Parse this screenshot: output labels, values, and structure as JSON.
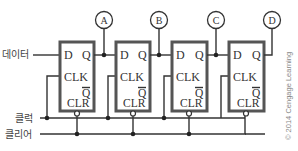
{
  "diagram": {
    "inputs": {
      "data_label": "데이터",
      "clock_label": "클럭",
      "clear_label": "클리어"
    },
    "outputs": [
      {
        "label": "A"
      },
      {
        "label": "B"
      },
      {
        "label": "C"
      },
      {
        "label": "D"
      }
    ],
    "flip_flops": [
      {
        "d": "D",
        "q": "Q",
        "clk": "CLK",
        "qbar": "Q",
        "clr": "CLR"
      },
      {
        "d": "D",
        "q": "Q",
        "clk": "CLK",
        "qbar": "Q",
        "clr": "CLR"
      },
      {
        "d": "D",
        "q": "Q",
        "clk": "CLK",
        "qbar": "Q",
        "clr": "CLR"
      },
      {
        "d": "D",
        "q": "Q",
        "clk": "CLK",
        "qbar": "Q",
        "clr": "CLR"
      }
    ],
    "copyright": "© 2014 Cengage Learning",
    "colors": {
      "wire": "#333333",
      "box_border": "#555555",
      "background": "#ffffff"
    }
  }
}
